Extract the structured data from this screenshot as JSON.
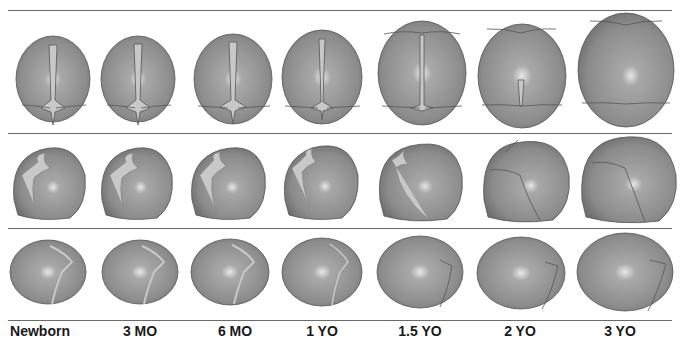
{
  "figure": {
    "rows": [
      {
        "view": "top"
      },
      {
        "view": "lateral-front"
      },
      {
        "view": "lateral-back"
      }
    ],
    "ages": [
      {
        "label": "Newborn",
        "x": 40
      },
      {
        "label": "3 MO",
        "x": 140
      },
      {
        "label": "6 MO",
        "x": 235
      },
      {
        "label": "1 YO",
        "x": 322
      },
      {
        "label": "1.5 YO",
        "x": 420
      },
      {
        "label": "2 YO",
        "x": 520
      },
      {
        "label": "3 YO",
        "x": 620
      }
    ],
    "colors": {
      "skull": "#8f8f8f",
      "skull_light": "#c9c9c9",
      "suture": "#d0d0d0",
      "line": "#6a6a6a"
    }
  }
}
